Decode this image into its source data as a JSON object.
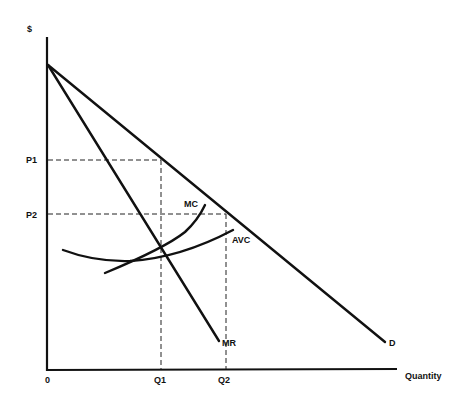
{
  "diagram": {
    "type": "monopoly pricing diagram",
    "y_axis_label": "$",
    "x_axis_label": "Quantity",
    "origin_label": "0",
    "price_labels": [
      "P1",
      "P2"
    ],
    "quantity_labels": [
      "Q1",
      "Q2"
    ],
    "curves": [
      {
        "name": "D",
        "label": "D",
        "description": "Demand curve, straight line from y-intercept down to the right"
      },
      {
        "name": "MR",
        "label": "MR",
        "description": "Marginal revenue, steeper straight line from same y-intercept"
      },
      {
        "name": "MC",
        "label": "MC",
        "description": "Marginal cost, upward-sloping curve"
      },
      {
        "name": "AVC",
        "label": "AVC",
        "description": "Average variable cost, U-shaped curve"
      }
    ],
    "guides": [
      {
        "from": "P1",
        "to": "Q1",
        "description": "P1 on demand at Q1 (MR = MC)"
      },
      {
        "from": "P2",
        "to": "Q2",
        "description": "P2 on demand at Q2"
      }
    ]
  }
}
